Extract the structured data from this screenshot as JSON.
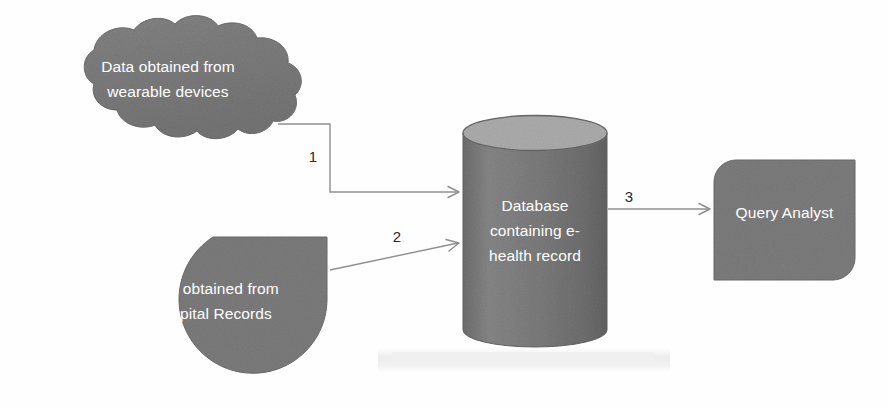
{
  "diagram": {
    "background_color": "#fefefe",
    "shape_fill": "#7f7f7f",
    "shape_fill_light": "#a9a9a9",
    "shape_outline": "#6a6a6a",
    "label_color": "#ffffff",
    "connector_color": "#8f8f8f",
    "number_color": "#2a2a2a"
  },
  "nodes": {
    "wearable_cloud": {
      "shape": "cloud",
      "label_line1": "Data obtained from",
      "label_line2": "wearable devices"
    },
    "hospital_oval": {
      "shape": "circle-flat-right",
      "label_line1": "Data obtained from",
      "label_line2": "Hospital Records"
    },
    "database_cylinder": {
      "shape": "cylinder",
      "label_line1": "Database",
      "label_line2": "containing e-",
      "label_line3": "health record"
    },
    "query_analyst_box": {
      "shape": "rounded-diagonal-rect",
      "label": "Query Analyst"
    }
  },
  "edges": [
    {
      "id": "edge-1",
      "number": "1",
      "from": "wearable_cloud",
      "to": "database_cylinder",
      "style": "elbow"
    },
    {
      "id": "edge-2",
      "number": "2",
      "from": "hospital_oval",
      "to": "database_cylinder",
      "style": "diagonal"
    },
    {
      "id": "edge-3",
      "number": "3",
      "from": "database_cylinder",
      "to": "query_analyst_box",
      "style": "straight"
    }
  ],
  "artifacts": {
    "scan_band": ""
  }
}
